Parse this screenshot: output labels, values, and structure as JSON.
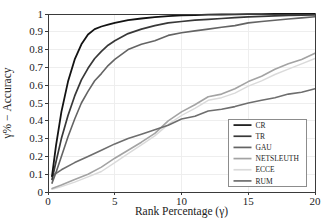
{
  "figure": {
    "background": "#ffffff",
    "frame_color": "#3a3a3a",
    "grid_color": "#ececec",
    "text_color": "#1c1c1c",
    "legend_border_color": "#8c8c8c"
  },
  "chart_data": {
    "type": "line",
    "title": "",
    "xlabel": "Rank Percentage (γ)",
    "ylabel": "γ% − Accuracy",
    "xlim": [
      0,
      20
    ],
    "ylim": [
      0,
      1
    ],
    "x_ticks": [
      0,
      5,
      10,
      15,
      20
    ],
    "x_tick_labels": [
      "0",
      "5",
      "10",
      "15",
      "20"
    ],
    "y_ticks": [
      0,
      0.1,
      0.2,
      0.3,
      0.4,
      0.5,
      0.6,
      0.7,
      0.8,
      0.9,
      1
    ],
    "y_tick_labels": [
      "0",
      "0.1",
      "0.2",
      "0.3",
      "0.4",
      "0.5",
      "0.6",
      "0.7",
      "0.8",
      "0.9",
      "1"
    ],
    "grid": true,
    "legend_position": "lower right",
    "series": [
      {
        "name": "CR",
        "color": "#131313",
        "width": 1.8,
        "x": [
          0.3,
          0.6,
          1,
          1.5,
          2,
          2.5,
          3,
          3.5,
          4,
          4.5,
          5,
          6,
          7,
          8,
          9,
          10,
          11,
          12,
          13,
          14,
          15,
          16,
          17,
          18,
          19,
          20
        ],
        "y": [
          0.09,
          0.26,
          0.45,
          0.62,
          0.745,
          0.83,
          0.885,
          0.915,
          0.93,
          0.94,
          0.95,
          0.965,
          0.975,
          0.982,
          0.988,
          0.992,
          0.994,
          0.996,
          0.997,
          0.998,
          0.999,
          0.999,
          1.0,
          1.0,
          1.0,
          1.0
        ]
      },
      {
        "name": "TR",
        "color": "#383838",
        "width": 1.7,
        "x": [
          0.3,
          0.6,
          1,
          1.5,
          2,
          2.5,
          3,
          3.5,
          4,
          4.5,
          5,
          6,
          7,
          8,
          9,
          10,
          11,
          12,
          13,
          14,
          15,
          16,
          17,
          18,
          19,
          20
        ],
        "y": [
          0.07,
          0.17,
          0.3,
          0.43,
          0.54,
          0.63,
          0.695,
          0.75,
          0.79,
          0.825,
          0.85,
          0.89,
          0.915,
          0.935,
          0.95,
          0.958,
          0.965,
          0.97,
          0.975,
          0.98,
          0.984,
          0.987,
          0.99,
          0.992,
          0.994,
          0.995
        ]
      },
      {
        "name": "GAU",
        "color": "#646464",
        "width": 1.6,
        "x": [
          0.3,
          0.6,
          1,
          1.5,
          2,
          2.5,
          3,
          3.5,
          4,
          4.5,
          5,
          6,
          7,
          8,
          9,
          10,
          11,
          12,
          13,
          14,
          15,
          16,
          17,
          18,
          19,
          20
        ],
        "y": [
          0.05,
          0.11,
          0.2,
          0.31,
          0.41,
          0.5,
          0.565,
          0.625,
          0.665,
          0.71,
          0.745,
          0.8,
          0.83,
          0.85,
          0.88,
          0.895,
          0.905,
          0.915,
          0.925,
          0.935,
          0.95,
          0.958,
          0.965,
          0.972,
          0.978,
          0.985
        ]
      },
      {
        "name": "NETSLEUTH",
        "color": "#a3a3a3",
        "width": 1.6,
        "x": [
          0.3,
          1,
          2,
          3,
          4,
          5,
          6,
          7,
          8,
          9,
          10,
          11,
          12,
          13,
          14,
          15,
          16,
          17,
          18,
          19,
          20
        ],
        "y": [
          0.02,
          0.04,
          0.07,
          0.1,
          0.14,
          0.19,
          0.235,
          0.28,
          0.33,
          0.4,
          0.45,
          0.49,
          0.535,
          0.55,
          0.58,
          0.62,
          0.65,
          0.69,
          0.72,
          0.745,
          0.78
        ]
      },
      {
        "name": "ECCE",
        "color": "#dadada",
        "width": 1.4,
        "x": [
          0.3,
          1,
          2,
          3,
          4,
          5,
          6,
          7,
          8,
          9,
          10,
          11,
          12,
          13,
          14,
          15,
          16,
          17,
          18,
          19,
          20
        ],
        "y": [
          0.015,
          0.03,
          0.055,
          0.085,
          0.115,
          0.165,
          0.215,
          0.265,
          0.315,
          0.38,
          0.43,
          0.47,
          0.515,
          0.53,
          0.555,
          0.595,
          0.625,
          0.66,
          0.69,
          0.72,
          0.75
        ]
      },
      {
        "name": "RUM",
        "color": "#6e6e6e",
        "width": 1.6,
        "x": [
          0.3,
          1,
          2,
          3,
          4,
          5,
          6,
          7,
          8,
          9,
          10,
          11,
          12,
          13,
          14,
          15,
          16,
          17,
          18,
          19,
          20
        ],
        "y": [
          0.09,
          0.125,
          0.165,
          0.2,
          0.235,
          0.27,
          0.3,
          0.325,
          0.35,
          0.375,
          0.41,
          0.425,
          0.455,
          0.465,
          0.48,
          0.5,
          0.515,
          0.53,
          0.55,
          0.56,
          0.58
        ]
      }
    ]
  }
}
